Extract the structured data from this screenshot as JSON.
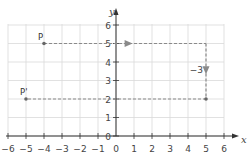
{
  "diagram": {
    "title": "",
    "axes": {
      "x_label": "x",
      "y_label": "y",
      "x_ticks": [
        "−6",
        "−5",
        "−4",
        "−3",
        "−2",
        "−1",
        "0",
        "1",
        "2",
        "3",
        "4",
        "5",
        "6"
      ],
      "y_ticks": [
        "0",
        "1",
        "2",
        "3",
        "4",
        "5",
        "6"
      ],
      "x_range": [
        -6,
        6
      ],
      "y_range": [
        0,
        6
      ]
    },
    "points": [
      {
        "label": "P",
        "x": -4,
        "y": 5
      },
      {
        "label": "P'",
        "x": -5,
        "y": 2
      }
    ],
    "translation": {
      "horizontal_arrow": {
        "from": [
          -4,
          5
        ],
        "to": [
          5,
          5
        ],
        "label": ""
      },
      "vertical_arrow": {
        "from": [
          5,
          5
        ],
        "to": [
          5,
          2
        ],
        "label": "−3"
      },
      "result_line": {
        "from": [
          5,
          2
        ],
        "to": [
          -5,
          2
        ]
      }
    },
    "colors": {
      "grid": "#d9d9d9",
      "axis": "#333333",
      "dashed": "#8a8a8a",
      "point": "#666666"
    }
  }
}
